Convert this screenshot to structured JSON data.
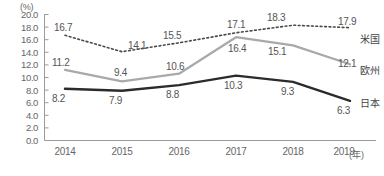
{
  "chart_data": {
    "type": "line",
    "title": "",
    "xlabel": "(年)",
    "ylabel": "(%)",
    "unit_label": "(%)",
    "year_unit": "(年)",
    "categories": [
      "2014",
      "2015",
      "2016",
      "2017",
      "2018",
      "2019"
    ],
    "ylim": [
      0.0,
      20.0
    ],
    "ytick_labels": [
      "20.0",
      "18.0",
      "16.0",
      "14.0",
      "12.0",
      "10.0",
      "8.0",
      "6.0",
      "4.0",
      "2.0",
      "0.0"
    ],
    "ytick_values": [
      20.0,
      18.0,
      16.0,
      14.0,
      12.0,
      10.0,
      8.0,
      6.0,
      4.0,
      2.0,
      0.0
    ],
    "grid": false,
    "legend_position": "right-inline",
    "series": [
      {
        "name": "米国",
        "style": "dotted",
        "color": "#4a4a4a",
        "values": [
          16.7,
          14.1,
          15.5,
          17.1,
          18.3,
          17.9
        ],
        "labels": [
          "16.7",
          "14.1",
          "15.5",
          "17.1",
          "18.3",
          "17.9"
        ]
      },
      {
        "name": "欧州",
        "style": "solid",
        "color": "#a9a9a9",
        "values": [
          11.2,
          9.4,
          10.6,
          16.4,
          15.1,
          12.1
        ],
        "labels": [
          "11.2",
          "9.4",
          "10.6",
          "16.4",
          "15.1",
          "12.1"
        ]
      },
      {
        "name": "日本",
        "style": "solid",
        "color": "#2b2b2b",
        "values": [
          8.2,
          7.9,
          8.8,
          10.3,
          9.3,
          6.3
        ],
        "labels": [
          "8.2",
          "7.9",
          "8.8",
          "10.3",
          "9.3",
          "6.3"
        ]
      }
    ]
  },
  "axis": {
    "unit": "(%)",
    "year_unit": "(年)"
  },
  "legend": {
    "us": "米国",
    "eu": "欧州",
    "jp": "日本"
  },
  "ylabels": {
    "t0": "20.0",
    "t1": "18.0",
    "t2": "16.0",
    "t3": "14.0",
    "t4": "12.0",
    "t5": "10.0",
    "t6": "8.0",
    "t7": "6.0",
    "t8": "4.0",
    "t9": "2.0",
    "t10": "0.0"
  },
  "xlabels": {
    "x0": "2014",
    "x1": "2015",
    "x2": "2016",
    "x3": "2017",
    "x4": "2018",
    "x5": "2019"
  },
  "datalabels": {
    "us": {
      "v0": "16.7",
      "v1": "14.1",
      "v2": "15.5",
      "v3": "17.1",
      "v4": "18.3",
      "v5": "17.9"
    },
    "eu": {
      "v0": "11.2",
      "v1": "9.4",
      "v2": "10.6",
      "v3": "16.4",
      "v4": "15.1",
      "v5": "12.1"
    },
    "jp": {
      "v0": "8.2",
      "v1": "7.9",
      "v2": "8.8",
      "v3": "10.3",
      "v4": "9.3",
      "v5": "6.3"
    }
  },
  "colors": {
    "us_line": "#4a4a4a",
    "eu_line": "#a9a9a9",
    "jp_line": "#2b2b2b",
    "axis": "#9a9a9a",
    "text": "#666666"
  }
}
